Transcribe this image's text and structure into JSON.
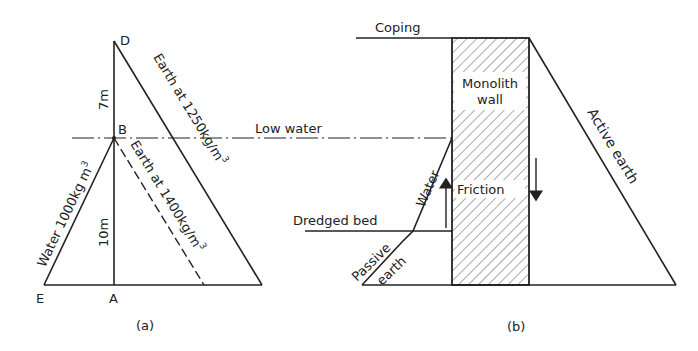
{
  "figure_a": {
    "caption": "(a)",
    "points": {
      "D": "D",
      "B": "B",
      "A": "A",
      "E": "E"
    },
    "dimensions": {
      "upper": "7m",
      "lower": "10m"
    },
    "labels": {
      "water": "Water 1000kg m",
      "water_sup": "3",
      "earth_upper": "Earth at 1250kg/m",
      "earth_upper_sup": "3",
      "earth_lower": "Earth at 1400kg/m",
      "earth_lower_sup": "3"
    }
  },
  "figure_b": {
    "caption": "(b)",
    "labels": {
      "coping": "Coping",
      "low_water": "Low water",
      "wall_line1": "Monolith",
      "wall_line2": "wall",
      "friction": "Friction",
      "dredged_bed": "Dredged bed",
      "water": "Water",
      "passive_line1": "Passive",
      "passive_line2": "earth",
      "active_earth": "Active earth"
    }
  },
  "colors": {
    "ink": "#222222",
    "background": "#ffffff"
  }
}
